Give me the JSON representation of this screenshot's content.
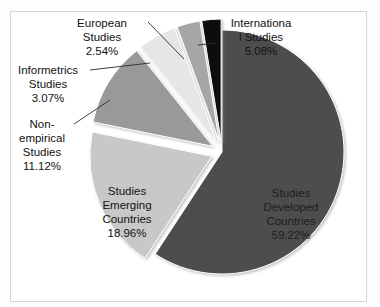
{
  "figure": {
    "background": "#ffffff",
    "frame_color": "#d5d5d5"
  },
  "chart_data": {
    "type": "pie",
    "title": "",
    "xlabel": "",
    "ylabel": "",
    "legend_position": "none",
    "grid": false,
    "labels_inside": [
      "Studies Developed Countries",
      "Studies Emerging Countries"
    ],
    "categories": [
      "Studies Developed Countries",
      "Studies Emerging Countries",
      "Non-empirical Studies",
      "International Studies",
      "Informetrics Studies",
      "European Studies"
    ],
    "values": [
      59.22,
      18.96,
      11.12,
      5.08,
      3.07,
      2.54
    ],
    "unit": "%",
    "slices": [
      {
        "name": "Studies Developed Countries",
        "value": 59.22,
        "value_text": "59.22%",
        "label_text": "Studies\nDeveloped\nCountries\n59.22%",
        "color": "#4d4d4d",
        "exploded": false,
        "label_placement": "inside"
      },
      {
        "name": "Studies Emerging Countries",
        "value": 18.96,
        "value_text": "18.96%",
        "label_text": "Studies\nEmerging\nCountries\n18.96%",
        "color": "#c8c8c8",
        "exploded": true,
        "label_placement": "inside"
      },
      {
        "name": "Non-empirical Studies",
        "value": 11.12,
        "value_text": "11.12%",
        "label_text": "Non-\nempirical\nStudies\n11.12%",
        "color": "#999999",
        "exploded": true,
        "label_placement": "callout"
      },
      {
        "name": "International Studies",
        "value": 5.08,
        "value_text": "5.08%",
        "label_text": "Internationa\nl Studies\n5.08%",
        "color": "#e6e6e6",
        "exploded": true,
        "label_placement": "callout"
      },
      {
        "name": "Informetrics Studies",
        "value": 3.07,
        "value_text": "3.07%",
        "label_text": "Informetrics\nStudies\n3.07%",
        "color": "#a6a6a6",
        "exploded": true,
        "label_placement": "callout"
      },
      {
        "name": "European Studies",
        "value": 2.54,
        "value_text": "2.54%",
        "label_text": "European\nStudies\n2.54%",
        "color": "#0a0a0a",
        "exploded": true,
        "label_placement": "callout"
      }
    ]
  }
}
